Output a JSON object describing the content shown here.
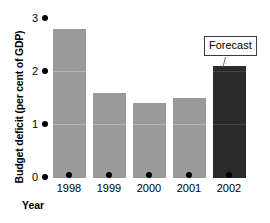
{
  "chart_data": {
    "type": "bar",
    "title": "",
    "xlabel": "Year",
    "ylabel": "Budget deficit (per cent of GDP)",
    "categories": [
      "1998",
      "1999",
      "2000",
      "2001",
      "2002"
    ],
    "values": [
      2.8,
      1.6,
      1.4,
      1.5,
      2.1
    ],
    "ylim": [
      0,
      3
    ],
    "yticks": [
      "0",
      "1",
      "2",
      "3"
    ],
    "ytick_values": [
      0,
      1,
      2,
      3
    ],
    "grid": false,
    "legend": "none",
    "annotations": [
      {
        "text": "Forecast",
        "target_category": "2002",
        "target_value": 2.1
      }
    ],
    "series": [
      {
        "name": "Budget deficit",
        "values": [
          2.8,
          1.6,
          1.4,
          1.5,
          2.1
        ],
        "bar_colors": [
          "#9a9a9a",
          "#9a9a9a",
          "#9a9a9a",
          "#9a9a9a",
          "#2b2b2b"
        ]
      }
    ],
    "colors": {
      "bar": "#9a9a9a",
      "forecast_bar": "#2b2b2b",
      "axis_text": "#000000",
      "callout_border": "#3b3b3b"
    }
  }
}
